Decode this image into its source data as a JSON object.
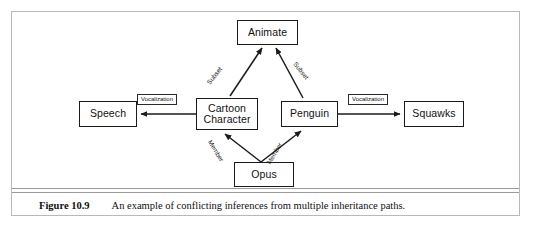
{
  "figure": {
    "caption_label": "Figure 10.9",
    "caption_text": "An example of conflicting inferences from multiple inheritance paths.",
    "border_color": "#b9b9b9",
    "rule_color": "#9b9b9b"
  },
  "diagram": {
    "type": "semantic-network-inheritance-graph",
    "node_border_color": "#1b1b1b",
    "edge_color": "#1b1b1b",
    "background": "#ffffff",
    "nodes": [
      {
        "id": "animate",
        "label": "Animate"
      },
      {
        "id": "speech",
        "label": "Speech"
      },
      {
        "id": "cartoon_character",
        "label": "Cartoon\nCharacter"
      },
      {
        "id": "penguin",
        "label": "Penguin"
      },
      {
        "id": "squawks",
        "label": "Squawks"
      },
      {
        "id": "opus",
        "label": "Opus"
      }
    ],
    "edges": [
      {
        "id": "cartoon_to_animate",
        "from": "cartoon_character",
        "to": "animate",
        "label": "Subset",
        "style": "diagonal-up-right"
      },
      {
        "id": "penguin_to_animate",
        "from": "penguin",
        "to": "animate",
        "label": "Subset",
        "style": "diagonal-up-left"
      },
      {
        "id": "cartoon_to_speech",
        "from": "cartoon_character",
        "to": "speech",
        "label": "Vocalization",
        "style": "horizontal-left"
      },
      {
        "id": "penguin_to_squawks",
        "from": "penguin",
        "to": "squawks",
        "label": "Vocalization",
        "style": "horizontal-right"
      },
      {
        "id": "opus_to_cartoon",
        "from": "opus",
        "to": "cartoon_character",
        "label": "Member",
        "style": "diagonal-up-left"
      },
      {
        "id": "opus_to_penguin",
        "from": "opus",
        "to": "penguin",
        "label": "Member",
        "style": "diagonal-up-right"
      }
    ],
    "edge_labels": {
      "subset_left": "Subset",
      "subset_right": "Subset",
      "vocalization_left": "Vocalization",
      "vocalization_right": "Vocalization",
      "member_left": "Member",
      "member_right": "Member"
    }
  }
}
